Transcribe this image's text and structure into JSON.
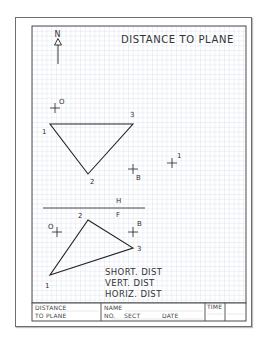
{
  "worksheet": {
    "title": "DISTANCE TO PLANE",
    "north_label": "N",
    "top_view": {
      "plane_points": [
        {
          "label": "1",
          "x": 50,
          "y": 124
        },
        {
          "label": "2",
          "x": 88,
          "y": 174
        },
        {
          "label": "3",
          "x": 133,
          "y": 124
        }
      ],
      "point_O_label": "O",
      "point_B_label": "B",
      "extra_point_label": "1"
    },
    "fold_line": {
      "upper_label": "H",
      "lower_label": "F"
    },
    "front_view": {
      "plane_points": [
        {
          "label": "1",
          "x": 50,
          "y": 275
        },
        {
          "label": "2",
          "x": 88,
          "y": 220
        },
        {
          "label": "3",
          "x": 133,
          "y": 248
        }
      ],
      "point_O_label": "O",
      "point_B_label": "B"
    },
    "answers": {
      "short_dist": "SHORT. DIST",
      "vert_dist": "VERT. DIST",
      "horiz_dist": "HORIZ. DIST"
    },
    "title_block": {
      "problem_line1": "DISTANCE",
      "problem_line2": "TO PLANE",
      "name_label": "NAME",
      "no_label": "NO.",
      "sect_label": "SECT",
      "date_label": "DATE",
      "time_label": "TIME"
    },
    "colors": {
      "grid_line": "#c9d3e3",
      "border": "#4a4a4a",
      "ink": "#222222"
    }
  }
}
